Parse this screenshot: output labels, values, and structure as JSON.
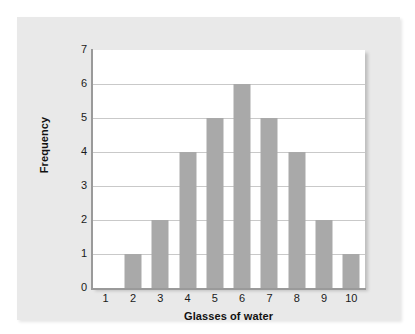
{
  "chart_data": {
    "type": "bar",
    "title": "",
    "xlabel": "Glasses of water",
    "ylabel": "Frequency",
    "categories": [
      "1",
      "2",
      "3",
      "4",
      "5",
      "6",
      "7",
      "8",
      "9",
      "10"
    ],
    "values": [
      0,
      1,
      2,
      4,
      5,
      6,
      5,
      4,
      2,
      1
    ],
    "ylim": [
      0,
      7
    ],
    "y_ticks": [
      "0",
      "1",
      "2",
      "3",
      "4",
      "5",
      "6",
      "7"
    ],
    "grid": true,
    "legend": "none",
    "bar_color": "#a9a9a9",
    "plot_background": "#ffffff",
    "card_background": "#e9e9e9",
    "gridline_color": "#c9c9c9",
    "axis_color": "#9a9a9a"
  }
}
